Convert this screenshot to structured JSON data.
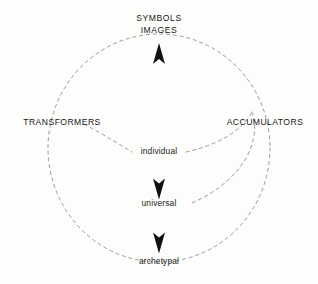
{
  "diagram": {
    "title_lines": [
      "SYMBOLS",
      "IMAGES"
    ],
    "axis_labels": {
      "left": "TRANSFORMERS",
      "right": "ACCUMULATORS"
    },
    "center_labels": [
      {
        "text": "individual",
        "level": 1
      },
      {
        "text": "universal",
        "level": 2
      },
      {
        "text": "archetypal",
        "level": 3
      }
    ],
    "arrows": [
      {
        "name": "arrow-up-symbols",
        "direction": "up"
      },
      {
        "name": "arrow-down-universal",
        "direction": "down"
      },
      {
        "name": "arrow-down-archetypal",
        "direction": "down"
      }
    ],
    "colors": {
      "background": "#fdfdfc",
      "stroke": "#8a8a8a",
      "text": "#171717",
      "arrow": "#111111"
    }
  }
}
